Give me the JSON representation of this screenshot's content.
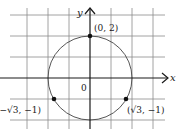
{
  "diagram": {
    "type": "coordinate-plane-circle",
    "axes": {
      "x_label": "x",
      "y_label": "y",
      "origin_label": "0"
    },
    "circle": {
      "center": [
        0,
        0
      ],
      "radius": 2,
      "color": "#555555"
    },
    "points": [
      {
        "label": "(0, 2)",
        "x": 0,
        "y": 2
      },
      {
        "label": "(√3, −1)",
        "x": 1.732,
        "y": -1
      },
      {
        "label": "(−√3, −1)",
        "x": -1.732,
        "y": -1
      }
    ],
    "grid": {
      "unit_px": 21,
      "x_range": [
        -3,
        3
      ],
      "y_range": [
        -2,
        3
      ]
    }
  }
}
